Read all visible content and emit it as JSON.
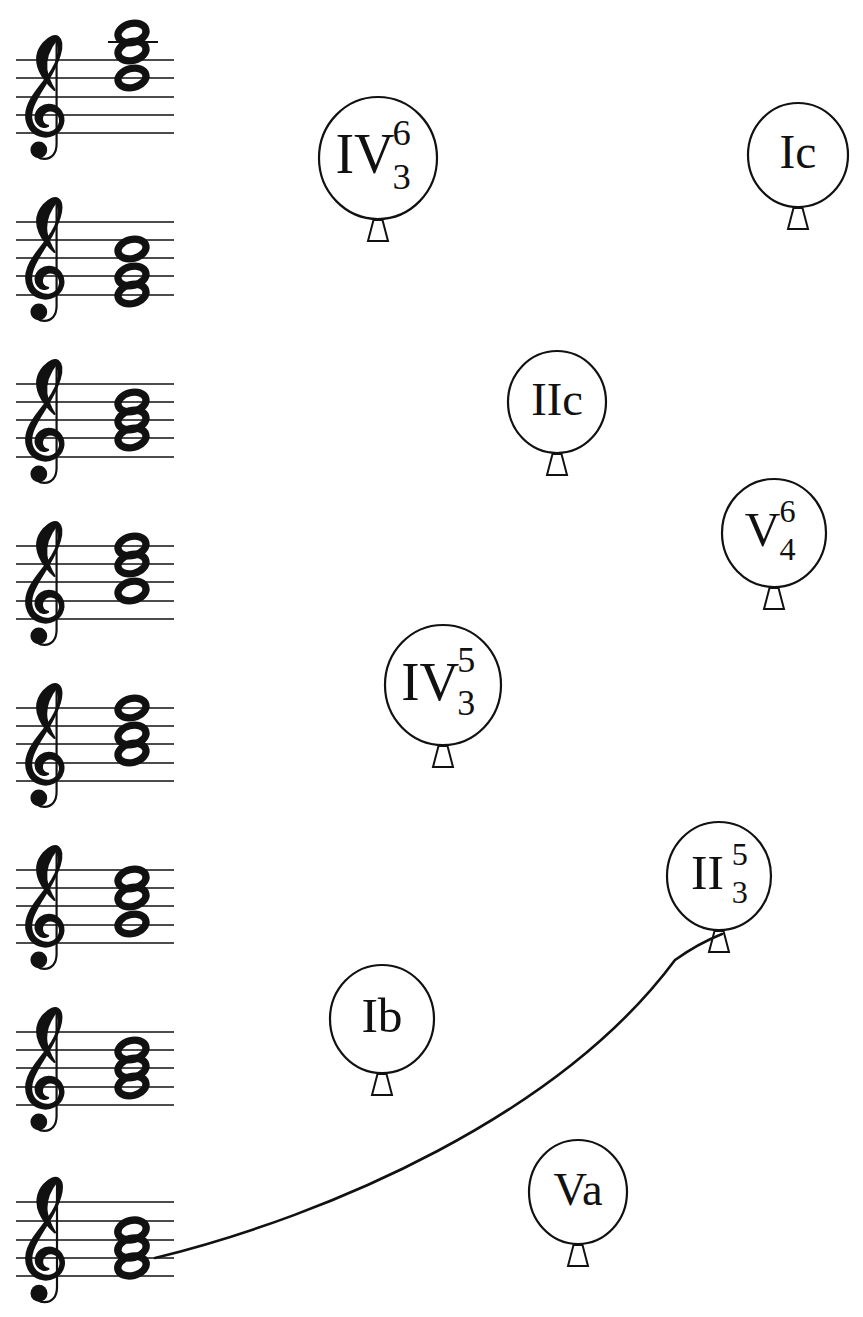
{
  "page": {
    "width": 863,
    "height": 1317,
    "background": "#ffffff",
    "ink": "#111111"
  },
  "staves": [
    {
      "id": "stave-1",
      "clef": "treble-clef",
      "x": 14,
      "y": 22,
      "line_y": [
        60,
        78,
        97,
        115,
        133
      ],
      "ledger_lines": [
        {
          "y": 42,
          "x1": 108,
          "x2": 158
        }
      ],
      "notes": [
        {
          "name": "notehead-1",
          "cy": 33,
          "filled": false
        },
        {
          "name": "notehead-2",
          "cy": 51,
          "filled": false
        },
        {
          "name": "notehead-3",
          "cy": 78,
          "filled": false
        }
      ]
    },
    {
      "id": "stave-2",
      "clef": "treble-clef",
      "x": 14,
      "y": 184,
      "line_y": [
        222,
        240,
        258,
        276,
        295
      ],
      "ledger_lines": [],
      "notes": [
        {
          "name": "notehead-1",
          "cy": 249,
          "filled": false
        },
        {
          "name": "notehead-2",
          "cy": 276,
          "filled": false
        },
        {
          "name": "notehead-3",
          "cy": 294,
          "filled": false
        }
      ]
    },
    {
      "id": "stave-3",
      "clef": "treble-clef",
      "x": 14,
      "y": 346,
      "line_y": [
        384,
        402,
        420,
        438,
        457
      ],
      "ledger_lines": [],
      "notes": [
        {
          "name": "notehead-1",
          "cy": 402,
          "filled": false
        },
        {
          "name": "notehead-2",
          "cy": 420,
          "filled": false
        },
        {
          "name": "notehead-3",
          "cy": 438,
          "filled": false
        }
      ]
    },
    {
      "id": "stave-4",
      "clef": "treble-clef",
      "x": 14,
      "y": 508,
      "line_y": [
        546,
        564,
        582,
        601,
        619
      ],
      "ledger_lines": [],
      "notes": [
        {
          "name": "notehead-1",
          "cy": 546,
          "filled": false
        },
        {
          "name": "notehead-2",
          "cy": 564,
          "filled": false
        },
        {
          "name": "notehead-3",
          "cy": 591,
          "filled": false
        }
      ]
    },
    {
      "id": "stave-5",
      "clef": "treble-clef",
      "x": 14,
      "y": 670,
      "line_y": [
        708,
        726,
        744,
        763,
        781
      ],
      "ledger_lines": [],
      "notes": [
        {
          "name": "notehead-1",
          "cy": 708,
          "filled": false
        },
        {
          "name": "notehead-2",
          "cy": 735,
          "filled": false
        },
        {
          "name": "notehead-3",
          "cy": 753,
          "filled": false
        }
      ]
    },
    {
      "id": "stave-6",
      "clef": "treble-clef",
      "x": 14,
      "y": 832,
      "line_y": [
        870,
        888,
        906,
        925,
        943
      ],
      "ledger_lines": [],
      "notes": [
        {
          "name": "notehead-1",
          "cy": 879,
          "filled": false
        },
        {
          "name": "notehead-2",
          "cy": 897,
          "filled": false
        },
        {
          "name": "notehead-3",
          "cy": 924,
          "filled": false
        }
      ]
    },
    {
      "id": "stave-7",
      "clef": "treble-clef",
      "x": 14,
      "y": 994,
      "line_y": [
        1032,
        1050,
        1068,
        1087,
        1105
      ],
      "ledger_lines": [],
      "notes": [
        {
          "name": "notehead-1",
          "cy": 1050,
          "filled": false
        },
        {
          "name": "notehead-2",
          "cy": 1068,
          "filled": false
        },
        {
          "name": "notehead-3",
          "cy": 1086,
          "filled": false
        }
      ]
    },
    {
      "id": "stave-8",
      "clef": "treble-clef",
      "x": 14,
      "y": 1164,
      "line_y": [
        1202,
        1221,
        1240,
        1258,
        1276
      ],
      "ledger_lines": [],
      "notes": [
        {
          "name": "notehead-1",
          "cy": 1230,
          "filled": false
        },
        {
          "name": "notehead-2",
          "cy": 1248,
          "filled": false
        },
        {
          "name": "notehead-3",
          "cy": 1266,
          "filled": false
        }
      ]
    }
  ],
  "balloons": [
    {
      "id": "balloon-iv-6-3",
      "label": "IV",
      "superscript": "6",
      "subscript": "3",
      "cx": 378,
      "cy": 158,
      "rx": 59,
      "ry": 61,
      "has_string": false
    },
    {
      "id": "balloon-ic",
      "label": "Ic",
      "superscript": "",
      "subscript": "",
      "cx": 798,
      "cy": 155,
      "rx": 50,
      "ry": 52,
      "has_string": false
    },
    {
      "id": "balloon-iic",
      "label": "IIc",
      "superscript": "",
      "subscript": "",
      "cx": 557,
      "cy": 402,
      "rx": 49,
      "ry": 51,
      "has_string": false
    },
    {
      "id": "balloon-v-6-4",
      "label": "V",
      "superscript": "6",
      "subscript": "4",
      "cx": 774,
      "cy": 533,
      "rx": 52,
      "ry": 54,
      "has_string": false
    },
    {
      "id": "balloon-iv-5-3",
      "label": "IV",
      "superscript": "5",
      "subscript": "3",
      "cx": 443,
      "cy": 685,
      "rx": 58,
      "ry": 60,
      "has_string": false
    },
    {
      "id": "balloon-ii-5-3",
      "label": "II",
      "superscript": "5",
      "subscript": "3",
      "cx": 719,
      "cy": 876,
      "rx": 52,
      "ry": 54,
      "has_string": true
    },
    {
      "id": "balloon-ib",
      "label": "Ib",
      "superscript": "",
      "subscript": "",
      "cx": 382,
      "cy": 1019,
      "rx": 52,
      "ry": 54,
      "has_string": false
    },
    {
      "id": "balloon-va",
      "label": "Va",
      "superscript": "",
      "subscript": "",
      "cx": 578,
      "cy": 1192,
      "rx": 49,
      "ry": 52,
      "has_string": false
    }
  ],
  "string": {
    "name": "balloon-string-stave8-to-ii53",
    "from_stave": "stave-8",
    "to_balloon": "balloon-ii-5-3",
    "path": "M 155 1258 C 330 1215 560 1115 675 960 C 696 945 712 938 722 934",
    "stroke_width": 2.6
  }
}
